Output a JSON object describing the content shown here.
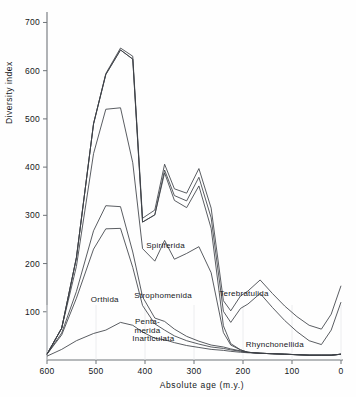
{
  "chart_data": {
    "type": "area",
    "title": "",
    "subtitle": "",
    "xlabel": "Absolute age (m.y.)",
    "ylabel": "Diversity index",
    "xlim": [
      600,
      0
    ],
    "ylim": [
      0,
      730
    ],
    "xticks": [
      600,
      500,
      400,
      300,
      200,
      100,
      0
    ],
    "yticks": [
      100,
      200,
      300,
      400,
      500,
      600,
      700
    ],
    "grid": false,
    "legend_position": "inline-annotations",
    "x_axis_direction": "reversed",
    "note": "Stacked (cumulative) diversity curves for brachiopod orders; band labels are drawn inside their own band.",
    "x": [
      600,
      570,
      540,
      505,
      480,
      450,
      425,
      405,
      380,
      360,
      340,
      315,
      290,
      265,
      240,
      225,
      205,
      190,
      165,
      140,
      115,
      90,
      65,
      40,
      20,
      0
    ],
    "series": [
      {
        "name": "Inarticulata",
        "label_xy": [
          383,
          40
        ],
        "values": [
          8,
          22,
          40,
          55,
          62,
          78,
          72,
          58,
          45,
          42,
          36,
          30,
          26,
          22,
          20,
          18,
          16,
          15,
          14,
          13,
          12,
          11,
          10,
          10,
          10,
          12
        ]
      },
      {
        "name": "Orthida",
        "label_xy": [
          482,
          120
        ],
        "values": [
          4,
          30,
          88,
          175,
          210,
          195,
          120,
          55,
          30,
          20,
          14,
          10,
          7,
          5,
          4,
          3,
          2,
          1,
          0,
          0,
          0,
          0,
          0,
          0,
          0,
          0
        ]
      },
      {
        "name": "Penta-merida",
        "label_xy": [
          395,
          75
        ],
        "values": [
          0,
          4,
          14,
          38,
          48,
          45,
          32,
          18,
          12,
          18,
          14,
          9,
          6,
          4,
          3,
          2,
          1,
          0,
          0,
          0,
          0,
          0,
          0,
          0,
          0,
          0
        ]
      },
      {
        "name": "Strophomenida",
        "label_xy": [
          363,
          128
        ],
        "values": [
          0,
          10,
          52,
          160,
          200,
          205,
          185,
          100,
          118,
          168,
          145,
          172,
          196,
          150,
          30,
          8,
          2,
          0,
          0,
          0,
          0,
          0,
          0,
          0,
          0,
          0
        ]
      },
      {
        "name": "Spiriferida",
        "label_xy": [
          358,
          232
        ],
        "values": [
          0,
          0,
          18,
          62,
          72,
          120,
          215,
          55,
          96,
          140,
          122,
          95,
          126,
          92,
          14,
          3,
          0,
          0,
          0,
          0,
          0,
          0,
          0,
          0,
          0,
          0
        ]
      },
      {
        "name": "Terebratulida",
        "label_xy": [
          198,
          133
        ],
        "values": [
          0,
          0,
          0,
          0,
          0,
          0,
          0,
          0,
          0,
          6,
          10,
          14,
          18,
          22,
          30,
          44,
          86,
          100,
          124,
          96,
          70,
          48,
          30,
          22,
          52,
          108
        ]
      },
      {
        "name": "Rhynchonellida",
        "label_xy": [
          135,
          26
        ],
        "values": [
          0,
          0,
          0,
          0,
          2,
          4,
          6,
          8,
          10,
          12,
          14,
          16,
          18,
          20,
          22,
          24,
          26,
          27,
          28,
          29,
          30,
          31,
          32,
          32,
          33,
          34
        ]
      }
    ]
  },
  "axis": {
    "y_label": "Diversity index",
    "x_label": "Absolute age (m.y.)",
    "y_tick_labels": [
      "700",
      "600",
      "500",
      "400",
      "300",
      "200",
      "100"
    ],
    "x_tick_labels": [
      "600",
      "500",
      "400",
      "300",
      "200",
      "100",
      "0"
    ]
  },
  "caption": {
    "text": ""
  },
  "colors": {
    "line": "#3c4046",
    "axis": "#6f7479",
    "text": "#15171a",
    "background": "#fefefe"
  }
}
